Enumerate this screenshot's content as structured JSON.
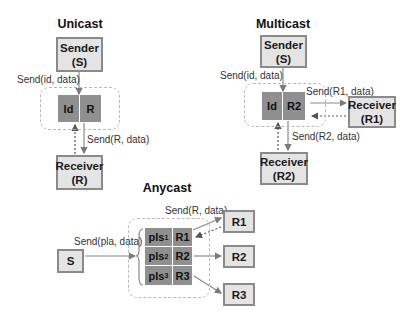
{
  "unicast": {
    "title": "Unicast",
    "sender": {
      "line1": "Sender",
      "line2": "(S)"
    },
    "table": {
      "id": "Id",
      "r": "R"
    },
    "receiver": {
      "line1": "Receiver",
      "line2": "(R)"
    },
    "send_in_label": "Send(id, data)",
    "send_out_label": "Send(R, data)"
  },
  "multicast": {
    "title": "Multicast",
    "sender": {
      "line1": "Sender",
      "line2": "(S)"
    },
    "table": {
      "id": "Id",
      "r": "R2"
    },
    "receiver1": {
      "line1": "Receiver",
      "line2": "(R1)"
    },
    "receiver2": {
      "line1": "Receiver",
      "line2": "(R2)"
    },
    "send_in_label": "Send(id, data)",
    "send_r1_label": "Send(R1, data)",
    "send_r2_label": "Send(R2, data)"
  },
  "anycast": {
    "title": "Anycast",
    "sender": {
      "line1": "S"
    },
    "send_in_label": "Send(pla, data)",
    "send_out_label": "Send(R, data)",
    "rows": [
      {
        "pls": "pls",
        "sub": "1",
        "r": "R1"
      },
      {
        "pls": "pls",
        "sub": "2",
        "r": "R2"
      },
      {
        "pls": "pls",
        "sub": "3",
        "r": "R3"
      }
    ],
    "receivers": [
      "R1",
      "R2",
      "R3"
    ]
  },
  "colors": {
    "box_fill": "#e4e4e4",
    "box_border": "#8a8a8a",
    "cell_fill": "#8f8f8f",
    "dashed": "#b8b8b8",
    "arrow": "#8a8a8a"
  }
}
